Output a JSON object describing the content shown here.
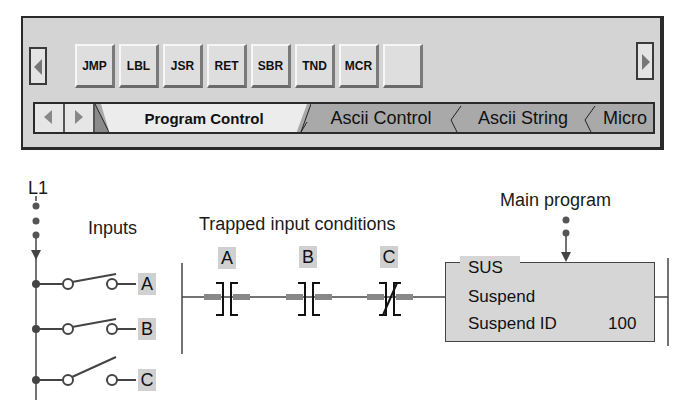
{
  "toolbar": {
    "scroll_left_icon": "triangle-left",
    "scroll_right_icon": "triangle-right",
    "buttons": [
      "JMP",
      "LBL",
      "JSR",
      "RET",
      "SBR",
      "TND",
      "MCR",
      ""
    ]
  },
  "tabbar": {
    "nav_left_icon": "triangle-left",
    "nav_right_icon": "triangle-right",
    "tabs": [
      {
        "label": "Program Control",
        "active": true
      },
      {
        "label": "Ascii Control",
        "active": false
      },
      {
        "label": "Ascii String",
        "active": false
      },
      {
        "label": "Micro",
        "active": false
      }
    ]
  },
  "diagram": {
    "rail_label": "L1",
    "inputs_label": "Inputs",
    "trapped_label": "Trapped input conditions",
    "main_program_label": "Main program",
    "inputs": [
      {
        "name": "A",
        "state": "open"
      },
      {
        "name": "B",
        "state": "open"
      },
      {
        "name": "C",
        "state": "open"
      }
    ],
    "contacts": [
      {
        "name": "A",
        "type": "normally-open"
      },
      {
        "name": "B",
        "type": "normally-open"
      },
      {
        "name": "C",
        "type": "normally-closed"
      }
    ],
    "instruction": {
      "mnemonic": "SUS",
      "description": "Suspend",
      "param_label": "Suspend ID",
      "param_value": "100"
    }
  }
}
